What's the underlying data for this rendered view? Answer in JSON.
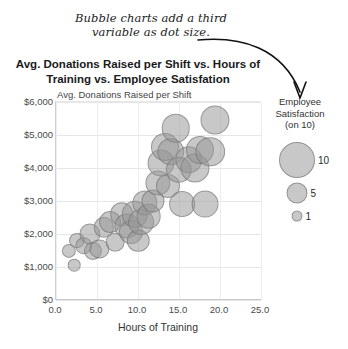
{
  "annotation": {
    "text": "Bubble charts add a third variable as dot size.",
    "arrow_icon": "curved-arrow-icon"
  },
  "chart_data": {
    "type": "scatter",
    "title": "Avg. Donations Raised per Shift vs. Hours of Training vs. Employee Satisfation",
    "xlabel": "Hours of Training",
    "ylabel": "Avg. Donations Raised per Shift",
    "xlim": [
      0,
      25
    ],
    "ylim": [
      0,
      6000
    ],
    "xticks": [
      "0.0",
      "5.0",
      "10.0",
      "15.0",
      "20.0",
      "25.0"
    ],
    "xtick_values": [
      0,
      5,
      10,
      15,
      20,
      25
    ],
    "yticks": [
      "$0",
      "$1,000",
      "$2,000",
      "$3,000",
      "$4,000",
      "$5,000",
      "$6,000"
    ],
    "ytick_values": [
      0,
      1000,
      2000,
      3000,
      4000,
      5000,
      6000
    ],
    "grid": true,
    "legend_position": "right",
    "size_legend": {
      "title": "Employee Satisfaction (on 10)",
      "title_line1": "Employee",
      "title_line2": "Satisfaction",
      "title_line3": "(on 10)",
      "entries": [
        {
          "label": "10",
          "value": 10
        },
        {
          "label": "5",
          "value": 5
        },
        {
          "label": "1",
          "value": 1
        }
      ]
    },
    "series_name": "Employees",
    "points": [
      {
        "x": 1.6,
        "y": 1500,
        "size": 3.0
      },
      {
        "x": 2.2,
        "y": 1050,
        "size": 2.4
      },
      {
        "x": 2.6,
        "y": 1800,
        "size": 3.6
      },
      {
        "x": 3.4,
        "y": 1650,
        "size": 4.2
      },
      {
        "x": 4.1,
        "y": 2000,
        "size": 5.5
      },
      {
        "x": 4.5,
        "y": 1500,
        "size": 4.4
      },
      {
        "x": 5.3,
        "y": 1550,
        "size": 4.8
      },
      {
        "x": 5.8,
        "y": 2200,
        "size": 5.2
      },
      {
        "x": 6.6,
        "y": 2350,
        "size": 5.8
      },
      {
        "x": 7.2,
        "y": 1750,
        "size": 4.6
      },
      {
        "x": 8.0,
        "y": 2600,
        "size": 6.4
      },
      {
        "x": 8.6,
        "y": 2250,
        "size": 7.0
      },
      {
        "x": 9.1,
        "y": 2050,
        "size": 6.6
      },
      {
        "x": 9.6,
        "y": 2600,
        "size": 7.4
      },
      {
        "x": 10.0,
        "y": 1800,
        "size": 6.0
      },
      {
        "x": 10.4,
        "y": 2350,
        "size": 7.2
      },
      {
        "x": 10.8,
        "y": 2950,
        "size": 7.0
      },
      {
        "x": 11.3,
        "y": 2550,
        "size": 6.8
      },
      {
        "x": 11.8,
        "y": 3000,
        "size": 6.2
      },
      {
        "x": 12.4,
        "y": 3550,
        "size": 7.0
      },
      {
        "x": 12.8,
        "y": 4150,
        "size": 7.6
      },
      {
        "x": 13.3,
        "y": 4650,
        "size": 8.0
      },
      {
        "x": 13.6,
        "y": 3450,
        "size": 6.6
      },
      {
        "x": 14.0,
        "y": 4500,
        "size": 7.8
      },
      {
        "x": 14.6,
        "y": 5200,
        "size": 8.2
      },
      {
        "x": 15.0,
        "y": 3950,
        "size": 7.4
      },
      {
        "x": 15.4,
        "y": 2900,
        "size": 7.2
      },
      {
        "x": 16.2,
        "y": 4250,
        "size": 7.8
      },
      {
        "x": 17.0,
        "y": 4000,
        "size": 8.4
      },
      {
        "x": 17.6,
        "y": 4550,
        "size": 8.0
      },
      {
        "x": 18.2,
        "y": 2900,
        "size": 7.6
      },
      {
        "x": 18.8,
        "y": 4500,
        "size": 8.6
      },
      {
        "x": 19.4,
        "y": 5450,
        "size": 8.4
      }
    ]
  }
}
